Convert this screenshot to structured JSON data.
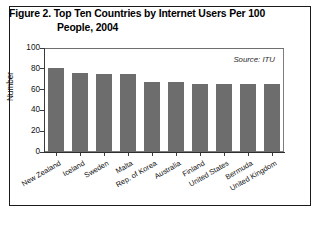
{
  "figure": {
    "title_line1": "Figure 2. Top Ten Countries by Internet Users Per 100",
    "title_line2": "People, 2004"
  },
  "chart_data": {
    "type": "bar",
    "title": "Figure 2. Top Ten Countries by Internet Users Per 100 People, 2004",
    "xlabel": "",
    "ylabel": "Number",
    "ylim": [
      0,
      100
    ],
    "yticks": [
      0,
      20,
      40,
      60,
      80,
      100
    ],
    "grid": false,
    "legend": null,
    "annotation": "Source: ITU",
    "bar_color": "#6d6d6d",
    "categories": [
      "New Zealand",
      "Iceland",
      "Sweden",
      "Malta",
      "Rep. of Korea",
      "Australia",
      "Finland",
      "United States",
      "Bermuda",
      "United Kingdom"
    ],
    "values": [
      81,
      76,
      75,
      75,
      67,
      67,
      65,
      65,
      65,
      65
    ]
  }
}
